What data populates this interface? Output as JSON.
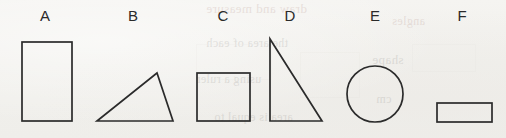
{
  "figure": {
    "background_color": "#f3f2ef",
    "stroke_color": "#2b2b2b",
    "label_color": "#2a2a2a",
    "baseline_y": 121
  },
  "labels": [
    {
      "text": "A",
      "x": 45,
      "y": 8
    },
    {
      "text": "B",
      "x": 133,
      "y": 8
    },
    {
      "text": "C",
      "x": 223,
      "y": 8
    },
    {
      "text": "D",
      "x": 290,
      "y": 8
    },
    {
      "text": "E",
      "x": 375,
      "y": 8
    },
    {
      "text": "F",
      "x": 462,
      "y": 8
    }
  ],
  "shapes": [
    {
      "label": "A",
      "kind": "rectangle",
      "orientation": "portrait",
      "x": 22,
      "y": 42,
      "width": 50,
      "height": 79
    },
    {
      "label": "B",
      "kind": "triangle",
      "orientation": "scalene",
      "points": "97,121 157,73 173,121"
    },
    {
      "label": "C",
      "kind": "square",
      "x": 197,
      "y": 73,
      "width": 53,
      "height": 48
    },
    {
      "label": "D",
      "kind": "triangle",
      "orientation": "right",
      "points": "270,39 270,121 322,121"
    },
    {
      "label": "E",
      "kind": "circle",
      "cx": 375,
      "cy": 94,
      "r": 28
    },
    {
      "label": "F",
      "kind": "rectangle",
      "orientation": "landscape",
      "x": 437,
      "y": 103,
      "width": 55,
      "height": 19
    }
  ],
  "bleed_through": {
    "note": "mirrored show-through text from the reverse side of the page",
    "lines": [
      "draw and measure",
      "angles",
      "the area of each",
      "shape",
      "using a ruler",
      "cm",
      "area is equal to"
    ]
  }
}
